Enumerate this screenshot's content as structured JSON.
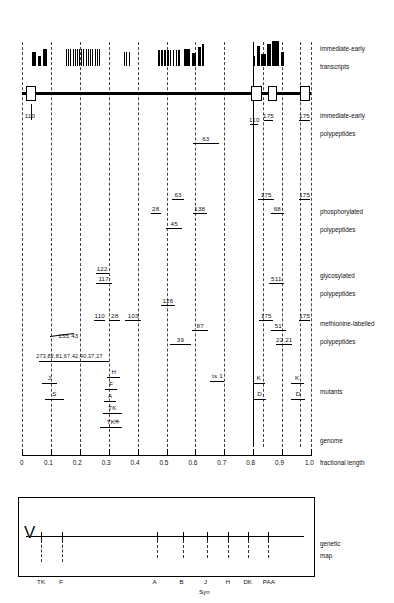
{
  "figure": {
    "axis": {
      "label": "fractional length",
      "ticks": [
        "0",
        "0.1",
        "0.2",
        "0.3",
        "0.4",
        "0.5",
        "0.6",
        "0.7",
        "0.8",
        "0.9",
        "1.0"
      ],
      "tick_values": [
        0,
        0.1,
        0.2,
        0.3,
        0.4,
        0.5,
        0.6,
        0.7,
        0.8,
        0.9,
        1.0
      ]
    },
    "row_labels": [
      {
        "id": "transcripts",
        "line1": "immediate-early",
        "line2": "transcripts"
      },
      {
        "id": "ie-polypeptides",
        "line1": "immediate-early",
        "line2": "polypeptides"
      },
      {
        "id": "phosphorylated",
        "line1": "phosphorylated",
        "line2": "polypeptides"
      },
      {
        "id": "glycosylated",
        "line1": "glycosylated",
        "line2": "polypeptides"
      },
      {
        "id": "methionine",
        "line1": "methionine-labelled",
        "line2": "polypeptides"
      },
      {
        "id": "mutants",
        "line1": "mutants",
        "line2": ""
      },
      {
        "id": "genome",
        "line1": "genome",
        "line2": ""
      },
      {
        "id": "geneticmap",
        "line1": "genetic",
        "line2": "map"
      }
    ],
    "transcript_bands": [
      {
        "x": 0.035,
        "w": 0.012,
        "h": 14
      },
      {
        "x": 0.055,
        "w": 0.01,
        "h": 10
      },
      {
        "x": 0.072,
        "w": 0.013,
        "h": 17
      },
      {
        "x": 0.152,
        "w": 0.004,
        "h": 17
      },
      {
        "x": 0.16,
        "w": 0.003,
        "h": 17
      },
      {
        "x": 0.167,
        "w": 0.004,
        "h": 17
      },
      {
        "x": 0.175,
        "w": 0.003,
        "h": 17
      },
      {
        "x": 0.182,
        "w": 0.004,
        "h": 17
      },
      {
        "x": 0.19,
        "w": 0.003,
        "h": 17
      },
      {
        "x": 0.197,
        "w": 0.004,
        "h": 17
      },
      {
        "x": 0.205,
        "w": 0.003,
        "h": 17
      },
      {
        "x": 0.212,
        "w": 0.004,
        "h": 17
      },
      {
        "x": 0.22,
        "w": 0.003,
        "h": 17
      },
      {
        "x": 0.228,
        "w": 0.004,
        "h": 17
      },
      {
        "x": 0.236,
        "w": 0.003,
        "h": 17
      },
      {
        "x": 0.243,
        "w": 0.004,
        "h": 17
      },
      {
        "x": 0.251,
        "w": 0.003,
        "h": 17
      },
      {
        "x": 0.258,
        "w": 0.004,
        "h": 17
      },
      {
        "x": 0.266,
        "w": 0.003,
        "h": 17
      },
      {
        "x": 0.352,
        "w": 0.004,
        "h": 14
      },
      {
        "x": 0.36,
        "w": 0.004,
        "h": 14
      },
      {
        "x": 0.37,
        "w": 0.003,
        "h": 14
      },
      {
        "x": 0.472,
        "w": 0.006,
        "h": 16
      },
      {
        "x": 0.482,
        "w": 0.006,
        "h": 16
      },
      {
        "x": 0.492,
        "w": 0.005,
        "h": 16
      },
      {
        "x": 0.501,
        "w": 0.006,
        "h": 16
      },
      {
        "x": 0.512,
        "w": 0.005,
        "h": 16
      },
      {
        "x": 0.521,
        "w": 0.006,
        "h": 16
      },
      {
        "x": 0.532,
        "w": 0.005,
        "h": 16
      },
      {
        "x": 0.541,
        "w": 0.006,
        "h": 16
      },
      {
        "x": 0.56,
        "w": 0.02,
        "h": 17
      },
      {
        "x": 0.588,
        "w": 0.014,
        "h": 13
      },
      {
        "x": 0.61,
        "w": 0.008,
        "h": 19
      },
      {
        "x": 0.622,
        "w": 0.008,
        "h": 22
      },
      {
        "x": 0.8,
        "w": 0.006,
        "h": 10
      },
      {
        "x": 0.812,
        "w": 0.01,
        "h": 20
      },
      {
        "x": 0.826,
        "w": 0.018,
        "h": 12
      },
      {
        "x": 0.848,
        "w": 0.013,
        "h": 22
      },
      {
        "x": 0.866,
        "w": 0.024,
        "h": 25
      },
      {
        "x": 0.896,
        "w": 0.01,
        "h": 14
      }
    ],
    "genome_boxes": [
      {
        "x": 0.013,
        "w": 0.03
      },
      {
        "x": 0.792,
        "w": 0.03
      },
      {
        "x": 0.852,
        "w": 0.022
      },
      {
        "x": 0.962,
        "w": 0.028
      }
    ],
    "ie_polypeptides": [
      {
        "label": "110",
        "x0": 0.03,
        "x1": 0.03,
        "row": 0
      },
      {
        "label": "63",
        "x0": 0.592,
        "x1": 0.68,
        "row": 0
      },
      {
        "label": "110",
        "x0": 0.79,
        "x1": 0.818,
        "row": 0
      },
      {
        "label": "175",
        "x0": 0.836,
        "x1": 0.87,
        "row": 1
      },
      {
        "label": "175",
        "x0": 0.96,
        "x1": 0.995,
        "row": 1
      }
    ],
    "phosphorylated": [
      {
        "label": "63",
        "x0": 0.52,
        "x1": 0.56
      },
      {
        "label": "138",
        "x0": 0.59,
        "x1": 0.64
      },
      {
        "label": "28",
        "x0": 0.445,
        "x1": 0.48
      },
      {
        "label": "45",
        "x0": 0.498,
        "x1": 0.555
      },
      {
        "label": "175",
        "x0": 0.818,
        "x1": 0.872
      },
      {
        "label": "175",
        "x0": 0.958,
        "x1": 0.998
      },
      {
        "label": "68",
        "x0": 0.862,
        "x1": 0.905
      }
    ],
    "glycosylated": [
      {
        "label": "122",
        "x0": 0.255,
        "x1": 0.3
      },
      {
        "label": "117",
        "x0": 0.255,
        "x1": 0.31
      },
      {
        "label": "511",
        "x0": 0.855,
        "x1": 0.905
      }
    ],
    "methionine": [
      {
        "label": "126",
        "x0": 0.48,
        "x1": 0.53
      },
      {
        "label": "110",
        "x0": 0.25,
        "x1": 0.288
      },
      {
        "label": "28",
        "x0": 0.302,
        "x1": 0.34
      },
      {
        "label": "103",
        "x0": 0.358,
        "x1": 0.412
      },
      {
        "label": "87",
        "x0": 0.588,
        "x1": 0.645
      },
      {
        "label": "39",
        "x0": 0.512,
        "x1": 0.585
      },
      {
        "label": "175",
        "x0": 0.82,
        "x1": 0.87
      },
      {
        "label": "175",
        "x0": 0.958,
        "x1": 0.998
      },
      {
        "label": "51",
        "x0": 0.862,
        "x1": 0.912
      },
      {
        "label": "22,21",
        "x0": 0.88,
        "x1": 0.935
      },
      {
        "label": "155,43",
        "x0": 0.098,
        "x1": 0.18
      },
      {
        "label": "273,82,81,67,42,40,37,27",
        "x0": 0.06,
        "x1": 0.3
      }
    ],
    "mutants": [
      {
        "label": "J",
        "x0": 0.07,
        "x1": 0.12
      },
      {
        "label": "S",
        "x0": 0.08,
        "x1": 0.145
      },
      {
        "label": "H",
        "x0": 0.295,
        "x1": 0.34
      },
      {
        "label": "F",
        "x0": 0.288,
        "x1": 0.33
      },
      {
        "label": "A",
        "x0": 0.285,
        "x1": 0.325
      },
      {
        "label": "TK",
        "x0": 0.28,
        "x1": 0.345
      },
      {
        "label": "TK",
        "x0": 0.27,
        "x1": 0.345,
        "marker": "*"
      },
      {
        "label": "ts 1",
        "x0": 0.65,
        "x1": 0.7
      },
      {
        "label": "K",
        "x0": 0.8,
        "x1": 0.84
      },
      {
        "label": "D",
        "x0": 0.8,
        "x1": 0.845
      },
      {
        "label": "K",
        "x0": 0.93,
        "x1": 0.975
      },
      {
        "label": "D",
        "x0": 0.93,
        "x1": 0.98
      }
    ],
    "genetic_map": {
      "markers": [
        {
          "label": "TK",
          "x": 0.055
        },
        {
          "label": "F",
          "x": 0.13
        },
        {
          "label": "A",
          "x": 0.47
        },
        {
          "label": "B",
          "x": 0.565
        },
        {
          "label": "J",
          "x": 0.652
        },
        {
          "label": "Syn",
          "x": 0.652
        },
        {
          "label": "H",
          "x": 0.728
        },
        {
          "label": "DK",
          "x": 0.8
        },
        {
          "label": "PAA",
          "x": 0.872
        }
      ]
    },
    "gridlines": [
      0.0,
      0.1,
      0.2,
      0.3,
      0.4,
      0.5,
      0.6,
      0.7,
      0.8,
      0.9,
      1.0
    ]
  }
}
